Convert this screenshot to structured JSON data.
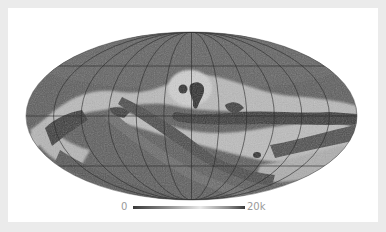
{
  "map": {
    "projection": "mollweide",
    "graticule": {
      "meridians": 12,
      "parallels": 6
    },
    "colors": {
      "frame": "#ebebeb",
      "panel": "#ffffff",
      "base": "#5a5a5a",
      "dark": "#383838",
      "mid": "#6e6e6e",
      "light": "#bdbdbd",
      "lightest": "#d9d9d9",
      "grid": "#2b2b2b"
    }
  },
  "colorbar": {
    "min_label": "0",
    "max_label": "20k",
    "gradient": [
      "#3a3a3a",
      "#8a8a8a",
      "#e6e6e6",
      "#8a8a8a",
      "#3a3a3a"
    ]
  }
}
